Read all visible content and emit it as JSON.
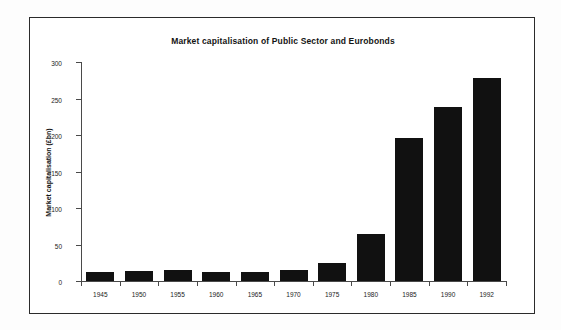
{
  "chart_data": {
    "type": "bar",
    "title": "Market capitalisation of Public Sector and Eurobonds",
    "xlabel": "",
    "ylabel": "Market capitalisation (£bn)",
    "categories": [
      "1945",
      "1950",
      "1955",
      "1960",
      "1965",
      "1970",
      "1975",
      "1980",
      "1985",
      "1990",
      "1992"
    ],
    "values": [
      13,
      14,
      15,
      13,
      13,
      15,
      24,
      65,
      196,
      239,
      278
    ],
    "ylim": [
      0,
      300
    ],
    "yticks": [
      0,
      50,
      100,
      150,
      200,
      250,
      300
    ],
    "ytick_labels": [
      "0",
      "50",
      "100",
      "150",
      "200",
      "250",
      "300"
    ],
    "grid": false,
    "legend": null,
    "bar_color": "#111111",
    "axis_color": "#4a4a4a",
    "frame_color": "#2b2b2b",
    "background": "#ffffff"
  }
}
